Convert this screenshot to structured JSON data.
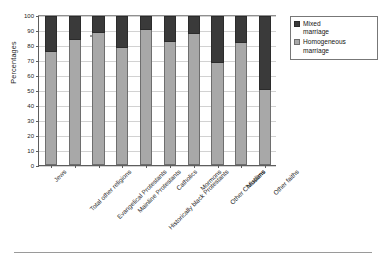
{
  "chart_data": {
    "type": "bar",
    "subtype": "stacked-100-percent",
    "title": "",
    "xlabel": "",
    "ylabel": "Percentages",
    "ylim": [
      0,
      100
    ],
    "yticks": [
      0,
      10,
      20,
      30,
      40,
      50,
      60,
      70,
      80,
      90,
      100
    ],
    "grid": true,
    "legend_position": "top-right",
    "categories": [
      "Jews",
      "Total other religions",
      "Evangelical Protestants",
      "Mainline Protestants",
      "Historically black Protestants",
      "Catholics",
      "Mormons",
      "Other Christians",
      "Muslims",
      "Other faiths"
    ],
    "series": [
      {
        "name": "Homogeneous marriage",
        "color": "#a8a8a8",
        "values": [
          76,
          84,
          89,
          79,
          91,
          83,
          88,
          69,
          82,
          51
        ]
      },
      {
        "name": "Mixed marriage",
        "color": "#3a3a3a",
        "values": [
          24,
          16,
          11,
          21,
          9,
          17,
          12,
          31,
          18,
          49
        ]
      }
    ]
  },
  "axes": {
    "y_title": "Percentages"
  },
  "legend": {
    "items": [
      {
        "label_line1": "Mixed",
        "label_line2": "marriage",
        "swatch": "mixed-swatch"
      },
      {
        "label_line1": "Homogeneous",
        "label_line2": "marriage",
        "swatch": "homogeneous-swatch"
      }
    ]
  }
}
